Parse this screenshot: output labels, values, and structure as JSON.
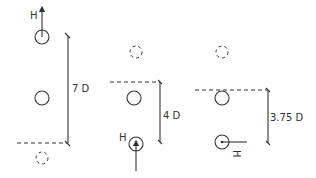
{
  "diagram": {
    "panels": [
      {
        "id": "panel-1",
        "distance_label": "7 D",
        "marker_label": "H",
        "marker_direction": "up",
        "marker_position": "top"
      },
      {
        "id": "panel-2",
        "distance_label": "4 D",
        "marker_label": "H",
        "marker_direction": "up",
        "marker_position": "bottom"
      },
      {
        "id": "panel-3",
        "distance_label": "3.75 D",
        "marker_label": "H",
        "marker_direction": "right",
        "marker_position": "bottom"
      }
    ],
    "colors": {
      "line": "#333333",
      "background": "#ffffff"
    }
  }
}
